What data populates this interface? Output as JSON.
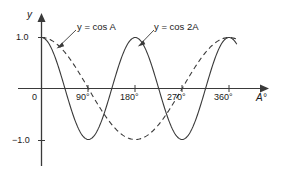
{
  "figure": {
    "background_color": "#ffffff",
    "line_color": "#3a3a3a",
    "text_color": "#1a1a1a"
  },
  "axes": {
    "y_axis_name": "y",
    "x_axis_name": "A°",
    "y_ticks": [
      "1.0",
      "0",
      "−1.0"
    ],
    "x_ticks": [
      "90°",
      "180°",
      "270°",
      "360°"
    ],
    "origin_label": "0"
  },
  "annotations": {
    "curve1_label": "y = cos A",
    "curve2_label": "y = cos 2A"
  },
  "chart_data": {
    "type": "line",
    "title": "",
    "xlabel": "A°",
    "ylabel": "y",
    "xlim": [
      0,
      400
    ],
    "ylim": [
      -1.4,
      1.3
    ],
    "grid": false,
    "legend_position": "inline-annotations",
    "x_ticks": [
      90,
      180,
      270,
      360
    ],
    "x_tick_labels": [
      "90°",
      "180°",
      "270°",
      "360°"
    ],
    "y_ticks": [
      1.0,
      0,
      -1.0
    ],
    "y_tick_labels": [
      "1.0",
      "0",
      "−1.0"
    ],
    "series": [
      {
        "name": "y = cos A",
        "style": "dashed",
        "color": "#3a3a3a",
        "x": [
          0,
          15,
          30,
          45,
          60,
          75,
          90,
          105,
          120,
          135,
          150,
          165,
          180,
          195,
          210,
          225,
          240,
          255,
          270,
          285,
          300,
          315,
          330,
          345,
          360
        ],
        "y": [
          1.0,
          0.966,
          0.866,
          0.707,
          0.5,
          0.259,
          0.0,
          -0.259,
          -0.5,
          -0.707,
          -0.866,
          -0.966,
          -1.0,
          -0.966,
          -0.866,
          -0.707,
          -0.5,
          -0.259,
          0.0,
          0.259,
          0.5,
          0.707,
          0.866,
          0.966,
          1.0
        ],
        "key_points": {
          "max_at": [
            0,
            360
          ],
          "min_at": [
            180
          ],
          "zeros_at": [
            90,
            270
          ]
        }
      },
      {
        "name": "y = cos 2A",
        "style": "solid",
        "color": "#3a3a3a",
        "x": [
          0,
          15,
          30,
          45,
          60,
          75,
          90,
          105,
          120,
          135,
          150,
          165,
          180,
          195,
          210,
          225,
          240,
          255,
          270,
          285,
          300,
          315,
          330,
          345,
          360
        ],
        "y": [
          1.0,
          0.866,
          0.5,
          0.0,
          -0.5,
          -0.866,
          -1.0,
          -0.866,
          -0.5,
          0.0,
          0.5,
          0.866,
          1.0,
          0.866,
          0.5,
          0.0,
          -0.5,
          -0.866,
          -1.0,
          -0.866,
          -0.5,
          0.0,
          0.5,
          0.866,
          1.0
        ],
        "key_points": {
          "max_at": [
            0,
            180,
            360
          ],
          "min_at": [
            90,
            270
          ],
          "zeros_at": [
            45,
            135,
            225,
            315
          ]
        }
      }
    ]
  }
}
